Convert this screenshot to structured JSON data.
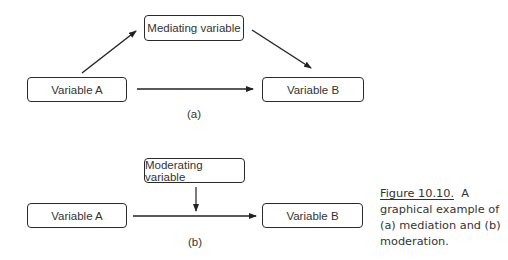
{
  "diagram_a": {
    "label": "(a)",
    "nodes": {
      "variable_a": "Variable A",
      "mediator": "Mediating variable",
      "variable_b": "Variable B"
    },
    "edges": [
      {
        "from": "Variable A",
        "to": "Mediating variable"
      },
      {
        "from": "Mediating variable",
        "to": "Variable B"
      },
      {
        "from": "Variable A",
        "to": "Variable B"
      }
    ]
  },
  "diagram_b": {
    "label": "(b)",
    "nodes": {
      "variable_a": "Variable A",
      "moderator": "Moderating variable",
      "variable_b": "Variable B"
    },
    "edges": [
      {
        "from": "Variable A",
        "to": "Variable B"
      },
      {
        "from": "Moderating variable",
        "to": "edge Variable A → Variable B"
      }
    ]
  },
  "caption": {
    "figure_number": "Figure 10.10.",
    "text": "A graphical example of (a) mediation and (b) moderation."
  }
}
